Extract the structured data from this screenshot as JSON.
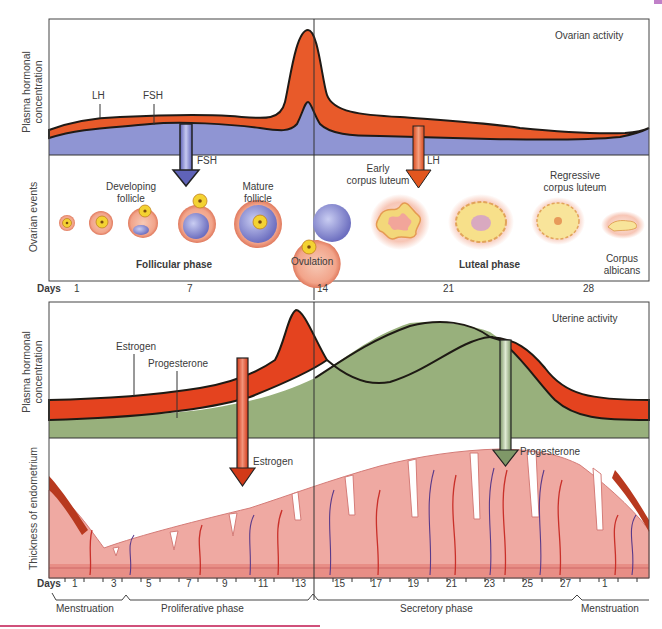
{
  "ovarian": {
    "title": "Ovarian activity",
    "y_label_line1": "Plasma hormonal",
    "y_label_line2": "concentration",
    "events_label": "Ovarian events",
    "hormones": {
      "lh": "LH",
      "fsh": "FSH"
    },
    "arrows": {
      "fsh": "FSH",
      "lh": "LH"
    },
    "stages": {
      "developing_follicle_1": "Developing",
      "developing_follicle_2": "follicle",
      "mature_follicle_1": "Mature",
      "mature_follicle_2": "follicle",
      "ovulation": "Ovulation",
      "early_cl_1": "Early",
      "early_cl_2": "corpus luteum",
      "regressive_cl_1": "Regressive",
      "regressive_cl_2": "corpus luteum",
      "albicans_1": "Corpus",
      "albicans_2": "albicans"
    },
    "phases": {
      "follicular": "Follicular phase",
      "luteal": "Luteal phase"
    },
    "days_label": "Days",
    "days": [
      "1",
      "7",
      "14",
      "21",
      "28"
    ]
  },
  "uterine": {
    "title": "Uterine activity",
    "y_label_line1": "Plasma hormonal",
    "y_label_line2": "concentration",
    "thickness_label": "Thickness of endometrium",
    "hormones": {
      "estrogen": "Estrogen",
      "progesterone": "Progesterone"
    },
    "arrows": {
      "estrogen": "Estrogen",
      "progesterone": "Progesterone"
    },
    "days_label": "Days",
    "days": [
      "1",
      "3",
      "5",
      "7",
      "9",
      "11",
      "13",
      "15",
      "17",
      "19",
      "21",
      "23",
      "25",
      "27",
      "1"
    ],
    "phases": {
      "menstruation_start": "Menstruation",
      "proliferative": "Proliferative phase",
      "secretory": "Secretory phase",
      "menstruation_end": "Menstruation"
    }
  },
  "colors": {
    "lh_orange": "#e85a2a",
    "fsh_blue": "#8f95d3",
    "estrogen_red": "#e4431f",
    "progesterone_green": "#98b07c",
    "endometrium_pink": "#efa9a2",
    "vessel_purple": "#5a3a8a",
    "footer_line": "#d0507a",
    "corner_tab": "#c080c8"
  }
}
